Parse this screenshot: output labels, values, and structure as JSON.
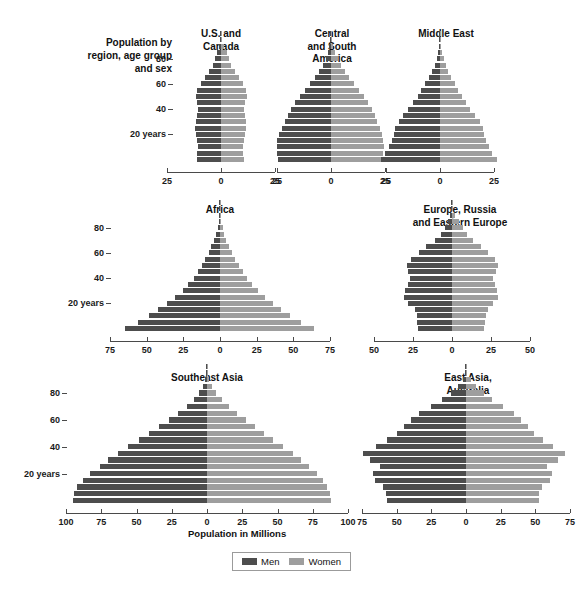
{
  "title_block": {
    "label": "Population\nby region,\nage group\nand sex"
  },
  "x_caption": "Population in Millions",
  "legend": {
    "men_label": "Men",
    "women_label": "Women",
    "men_color": "#4d4d4d",
    "women_color": "#9e9e9e"
  },
  "age_labels": [
    "80",
    "60",
    "40",
    "20 years"
  ],
  "chart_data": {
    "type": "bar",
    "subtype": "population-pyramid",
    "title": "Population by region, age group and sex",
    "xlabel": "Population in Millions",
    "ylabel": "Age group",
    "grid": false,
    "legend": [
      "Men",
      "Women"
    ],
    "legend_position": "bottom-center",
    "age_groups": [
      "0-4",
      "5-9",
      "10-14",
      "15-19",
      "20-24",
      "25-29",
      "30-34",
      "35-39",
      "40-44",
      "45-49",
      "50-54",
      "55-59",
      "60-64",
      "65-69",
      "70-74",
      "75-79",
      "80-84",
      "85-89",
      "90-94",
      "95-99",
      "100+"
    ],
    "age_tick_labels": [
      "20 years",
      "40",
      "60",
      "80"
    ],
    "panels": [
      {
        "name": "U.S. and Canada",
        "title": "U.S. and\nCanada",
        "xlim": [
          -25,
          25
        ],
        "xticks": [
          -25,
          0,
          25
        ],
        "xtick_labels": [
          "25",
          "0",
          "25"
        ],
        "series": [
          {
            "name": "Men",
            "values": [
              11.2,
              10.9,
              10.8,
              11.0,
              11.8,
              12.2,
              11.6,
              11.0,
              10.6,
              10.9,
              11.6,
              11.0,
              9.4,
              7.6,
              5.6,
              3.8,
              2.7,
              1.8,
              0.9,
              0.3,
              0.1
            ]
          },
          {
            "name": "Women",
            "values": [
              10.7,
              10.4,
              10.3,
              10.5,
              11.3,
              11.8,
              11.4,
              10.9,
              10.6,
              11.0,
              11.9,
              11.5,
              10.0,
              8.3,
              6.4,
              4.6,
              3.6,
              2.8,
              1.6,
              0.6,
              0.2
            ]
          }
        ]
      },
      {
        "name": "Central and South America",
        "title": "Central\nand South\nAmerica",
        "xlim": [
          -25,
          25
        ],
        "xticks": [
          -25,
          0,
          25
        ],
        "xtick_labels": [
          "25",
          "0",
          "25"
        ],
        "series": [
          {
            "name": "Men",
            "values": [
              24.5,
              25.0,
              25.2,
              24.8,
              24.0,
              22.8,
              21.4,
              20.0,
              18.4,
              16.6,
              14.4,
              12.0,
              9.6,
              7.4,
              5.4,
              3.8,
              2.4,
              1.4,
              0.7,
              0.2,
              0.05
            ]
          },
          {
            "name": "Women",
            "values": [
              23.6,
              24.1,
              24.4,
              24.2,
              23.6,
              22.6,
              21.4,
              20.2,
              18.8,
              17.2,
              15.2,
              12.9,
              10.6,
              8.4,
              6.4,
              4.7,
              3.2,
              2.0,
              1.1,
              0.4,
              0.1
            ]
          }
        ]
      },
      {
        "name": "Middle East",
        "title": "Middle East",
        "xlim": [
          -25,
          25
        ],
        "xticks": [
          -25,
          0,
          25
        ],
        "xtick_labels": [
          "25",
          "0",
          "25"
        ],
        "series": [
          {
            "name": "Men",
            "values": [
              27.5,
              25.5,
              23.6,
              22.2,
              21.4,
              20.8,
              19.2,
              17.0,
              14.6,
              12.4,
              10.4,
              8.6,
              6.9,
              5.2,
              3.7,
              2.5,
              1.6,
              0.9,
              0.4,
              0.15,
              0.04
            ]
          },
          {
            "name": "Women",
            "values": [
              26.2,
              24.3,
              22.5,
              21.2,
              20.4,
              19.8,
              18.3,
              16.2,
              14.0,
              12.0,
              10.1,
              8.4,
              6.8,
              5.2,
              3.8,
              2.7,
              1.8,
              1.1,
              0.5,
              0.2,
              0.05
            ]
          }
        ]
      },
      {
        "name": "Africa",
        "title": "Africa",
        "xlim": [
          -75,
          75
        ],
        "xticks": [
          -75,
          -50,
          -25,
          0,
          25,
          50,
          75
        ],
        "xtick_labels": [
          "75",
          "50",
          "25",
          "0",
          "25",
          "50",
          "75"
        ],
        "series": [
          {
            "name": "Men",
            "values": [
              65.0,
              56.0,
              48.5,
              42.0,
              36.0,
              30.5,
              25.5,
              21.5,
              18.0,
              15.0,
              12.4,
              10.0,
              7.8,
              5.8,
              4.0,
              2.6,
              1.5,
              0.8,
              0.35,
              0.12,
              0.03
            ]
          },
          {
            "name": "Women",
            "values": [
              64.0,
              55.2,
              47.8,
              41.5,
              35.8,
              30.6,
              25.8,
              21.9,
              18.5,
              15.5,
              12.9,
              10.5,
              8.3,
              6.3,
              4.4,
              3.0,
              1.8,
              1.0,
              0.45,
              0.16,
              0.04
            ]
          }
        ]
      },
      {
        "name": "Europe, Russia and Eastern Europe",
        "title": "Europe, Russia\nand Eastern Europe",
        "xlim": [
          -50,
          50
        ],
        "xticks": [
          -50,
          -25,
          0,
          25,
          50
        ],
        "xtick_labels": [
          "50",
          "25",
          "0",
          "25",
          "50"
        ],
        "series": [
          {
            "name": "Men",
            "values": [
              22.0,
              22.4,
              22.6,
              24.0,
              28.0,
              31.0,
              30.0,
              28.5,
              27.0,
              28.4,
              29.0,
              26.0,
              21.0,
              16.4,
              11.0,
              7.0,
              4.4,
              2.4,
              1.0,
              0.3,
              0.06
            ]
          },
          {
            "name": "Women",
            "values": [
              20.8,
              21.2,
              21.5,
              22.8,
              26.6,
              29.6,
              29.0,
              27.8,
              26.6,
              28.4,
              29.6,
              27.4,
              23.0,
              18.8,
              13.6,
              9.6,
              7.0,
              4.4,
              2.0,
              0.6,
              0.12
            ]
          }
        ]
      },
      {
        "name": "Southeast Asia",
        "title": "Southeast Asia",
        "xlim": [
          -100,
          100
        ],
        "xticks": [
          -100,
          -75,
          -50,
          -25,
          0,
          25,
          50,
          75,
          100
        ],
        "xtick_labels": [
          "100",
          "75",
          "50",
          "25",
          "0",
          "25",
          "50",
          "75",
          "100"
        ],
        "series": [
          {
            "name": "Men",
            "values": [
              95.0,
              94.0,
              92.0,
              88.0,
              83.0,
              76.0,
              70.0,
              63.0,
              56.0,
              48.0,
              41.0,
              34.0,
              27.0,
              20.5,
              14.5,
              9.5,
              5.5,
              3.0,
              1.3,
              0.4,
              0.1
            ]
          },
          {
            "name": "Women",
            "values": [
              88.0,
              87.0,
              85.0,
              82.0,
              78.0,
              72.0,
              67.0,
              61.0,
              54.0,
              47.0,
              40.5,
              34.0,
              27.5,
              21.5,
              15.5,
              10.5,
              6.5,
              3.6,
              1.7,
              0.6,
              0.15
            ]
          }
        ]
      },
      {
        "name": "East Asia, Australia",
        "title": "East Asia,\nAustralia",
        "xlim": [
          -75,
          75
        ],
        "xticks": [
          -75,
          -50,
          -25,
          0,
          25,
          50,
          75
        ],
        "xtick_labels": [
          "75",
          "50",
          "25",
          "0",
          "25",
          "50",
          "75"
        ],
        "series": [
          {
            "name": "Men",
            "values": [
              57.0,
              57.5,
              59.5,
              65.5,
              67.0,
              62.0,
              69.0,
              74.5,
              65.0,
              57.0,
              50.0,
              45.0,
              40.0,
              34.0,
              25.0,
              17.0,
              10.5,
              5.5,
              2.2,
              0.6,
              0.1
            ]
          },
          {
            "name": "Women",
            "values": [
              52.5,
              53.0,
              55.0,
              60.5,
              62.0,
              58.5,
              66.0,
              71.5,
              63.0,
              55.5,
              49.0,
              44.5,
              40.0,
              34.5,
              26.5,
              19.0,
              13.0,
              7.5,
              3.3,
              1.0,
              0.2
            ]
          }
        ]
      }
    ]
  }
}
